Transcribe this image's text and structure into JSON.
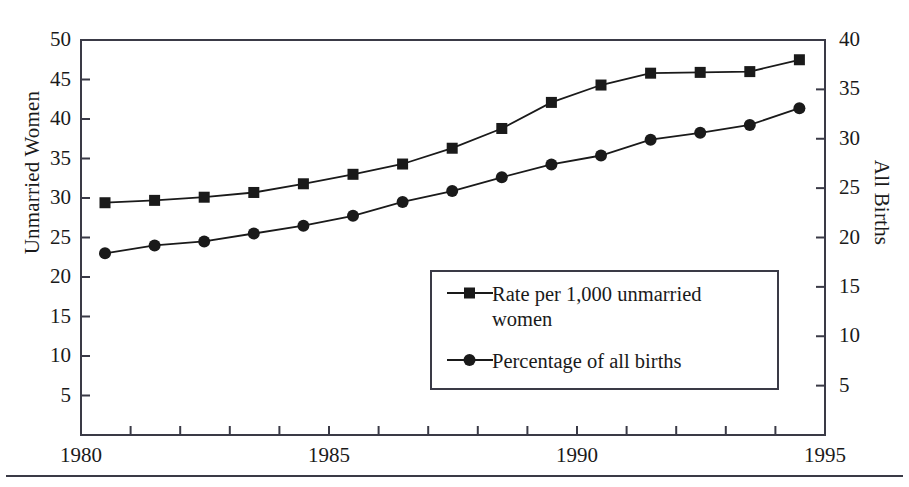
{
  "axes": {
    "left": {
      "title": "Unmarried Women",
      "ticks": [
        "50",
        "45",
        "40",
        "35",
        "30",
        "25",
        "20",
        "15",
        "10",
        "5"
      ],
      "min": 0,
      "max": 50,
      "step": 5
    },
    "right": {
      "title": "All Births",
      "ticks": [
        "40",
        "35",
        "30",
        "25",
        "20",
        "15",
        "10",
        "5"
      ],
      "min": 0,
      "max": 40,
      "step": 5
    },
    "x": {
      "labels": [
        "1980",
        "1985",
        "1990",
        "1995"
      ],
      "min": 1980,
      "max": 1995,
      "tick_step": 1
    }
  },
  "legend": {
    "items": [
      {
        "marker": "square",
        "label": "Rate per 1,000 unmarried\nwomen"
      },
      {
        "marker": "circle",
        "label": "Percentage of all births"
      }
    ]
  },
  "colors": {
    "line": "#1a1a1a",
    "frame": "#3a3a46",
    "background": "#ffffff",
    "rule": "#3a3a46"
  },
  "chart_data": {
    "type": "line",
    "title": "",
    "xlabel": "",
    "ylabel": "Unmarried Women",
    "y2label": "All Births",
    "x": [
      1980,
      1981,
      1982,
      1983,
      1984,
      1985,
      1986,
      1987,
      1988,
      1989,
      1990,
      1991,
      1992,
      1993,
      1994
    ],
    "xlim": [
      1980,
      1995
    ],
    "ylim": [
      0,
      50
    ],
    "y2lim": [
      0,
      40
    ],
    "grid": false,
    "legend_position": "center",
    "series": [
      {
        "name": "Rate per 1,000 unmarried women",
        "axis": "left",
        "marker": "square",
        "values": [
          29.4,
          29.7,
          30.1,
          30.7,
          31.8,
          33.0,
          34.3,
          36.3,
          38.8,
          42.1,
          44.3,
          45.8,
          45.9,
          46.0,
          47.5
        ]
      },
      {
        "name": "Percentage of all births",
        "axis": "right",
        "marker": "circle",
        "values": [
          18.4,
          19.2,
          19.6,
          20.4,
          21.2,
          22.2,
          23.6,
          24.7,
          26.1,
          27.4,
          28.3,
          29.9,
          30.6,
          31.4,
          33.1
        ]
      }
    ]
  }
}
